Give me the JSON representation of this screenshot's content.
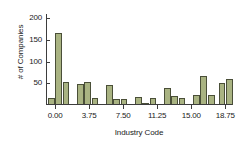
{
  "chart_data": {
    "type": "bar",
    "title": "",
    "subtitle": "",
    "xlabel": "Industry Code",
    "ylabel": "# of Companies",
    "xlim": [
      -1,
      19.5
    ],
    "ylim": [
      0,
      210
    ],
    "grid": false,
    "legend": null,
    "annotations": [],
    "bar_color": "#a9b382",
    "bar_edge_color": "#4a4f38",
    "axis_color": "#3d3d3d",
    "text_color": "#1a1a1a",
    "background": "#ffffff",
    "xticks": [
      "0.00",
      "3.75",
      "7.50",
      "11.25",
      "15.00",
      "18.75"
    ],
    "xtick_values": [
      0.0,
      3.75,
      7.5,
      11.25,
      15.0,
      18.75
    ],
    "yticks": [
      "50",
      "100",
      "150",
      "200"
    ],
    "ytick_values": [
      50,
      100,
      150,
      200
    ],
    "bin_width": 0.75,
    "categories": [
      -0.4,
      0.4,
      1.2,
      2.8,
      3.6,
      4.4,
      6.0,
      6.8,
      7.6,
      9.2,
      10.0,
      10.8,
      12.4,
      13.2,
      14.0,
      15.6,
      16.4,
      17.2,
      18.4,
      19.2
    ],
    "values": [
      17,
      167,
      54,
      48,
      52,
      17,
      46,
      14,
      14,
      18,
      3,
      17,
      40,
      21,
      17,
      23,
      66,
      24,
      51,
      61
    ],
    "bars": [
      {
        "label": "bin-1",
        "x": -0.4,
        "value": 17
      },
      {
        "label": "bin-2",
        "x": 0.4,
        "value": 167
      },
      {
        "label": "bin-3",
        "x": 1.2,
        "value": 54
      },
      {
        "label": "bin-4",
        "x": 2.8,
        "value": 48
      },
      {
        "label": "bin-5",
        "x": 3.6,
        "value": 52
      },
      {
        "label": "bin-6",
        "x": 4.4,
        "value": 17
      },
      {
        "label": "bin-7",
        "x": 6.0,
        "value": 46
      },
      {
        "label": "bin-8",
        "x": 6.8,
        "value": 14
      },
      {
        "label": "bin-9",
        "x": 7.6,
        "value": 14
      },
      {
        "label": "bin-10",
        "x": 9.2,
        "value": 18
      },
      {
        "label": "bin-11",
        "x": 10.0,
        "value": 3
      },
      {
        "label": "bin-12",
        "x": 10.8,
        "value": 17
      },
      {
        "label": "bin-13",
        "x": 12.4,
        "value": 40
      },
      {
        "label": "bin-14",
        "x": 13.2,
        "value": 21
      },
      {
        "label": "bin-15",
        "x": 14.0,
        "value": 17
      },
      {
        "label": "bin-16",
        "x": 15.6,
        "value": 23
      },
      {
        "label": "bin-17",
        "x": 16.4,
        "value": 66
      },
      {
        "label": "bin-18",
        "x": 17.2,
        "value": 24
      },
      {
        "label": "bin-19",
        "x": 18.4,
        "value": 51
      },
      {
        "label": "bin-20",
        "x": 19.2,
        "value": 61
      }
    ]
  }
}
